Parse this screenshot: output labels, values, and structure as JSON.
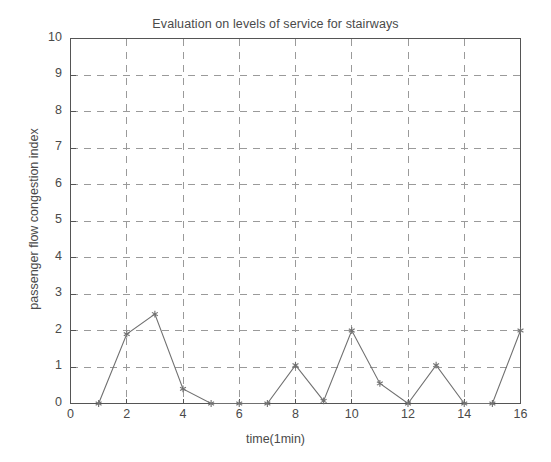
{
  "chart_data": {
    "type": "line",
    "title": "Evaluation on levels of service for stairways",
    "xlabel": "time(1min)",
    "ylabel": "passenger flow congestion index",
    "xlim": [
      0,
      16
    ],
    "ylim": [
      0,
      10
    ],
    "grid": true,
    "grid_style": "dashed",
    "legend": null,
    "marker": "asterisk",
    "line_color": "#707070",
    "axis_color": "#555555",
    "grid_color": "#9a9a9a",
    "background": "#ffffff",
    "xticks": [
      0,
      2,
      4,
      6,
      8,
      10,
      12,
      14,
      16
    ],
    "xtick_labels": [
      "0",
      "2",
      "4",
      "6",
      "8",
      "10",
      "12",
      "14",
      "16"
    ],
    "yticks": [
      0,
      1,
      2,
      3,
      4,
      5,
      6,
      7,
      8,
      9,
      10
    ],
    "ytick_labels": [
      "0",
      "1",
      "2",
      "3",
      "4",
      "5",
      "6",
      "7",
      "8",
      "9",
      "10"
    ],
    "x": [
      1,
      2,
      3,
      4,
      5,
      6,
      7,
      8,
      9,
      10,
      11,
      12,
      13,
      14,
      15,
      16
    ],
    "values": [
      0,
      1.9,
      2.45,
      0.4,
      0,
      0,
      0,
      1.05,
      0.07,
      2.0,
      0.55,
      0,
      1.05,
      0,
      0,
      2.0
    ],
    "series": [
      {
        "name": "passenger flow congestion index",
        "x": [
          1,
          2,
          3,
          4,
          5,
          6,
          7,
          8,
          9,
          10,
          11,
          12,
          13,
          14,
          15,
          16
        ],
        "values": [
          0,
          1.9,
          2.45,
          0.4,
          0,
          0,
          0,
          1.05,
          0.07,
          2.0,
          0.55,
          0,
          1.05,
          0,
          0,
          2.0
        ]
      }
    ]
  }
}
